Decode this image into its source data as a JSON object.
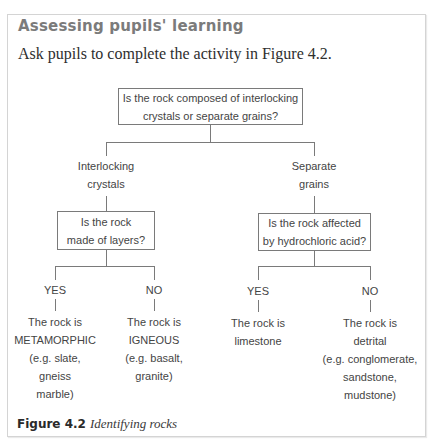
{
  "section": {
    "heading": "Assessing pupils' learning",
    "intro": "Ask pupils to complete the activity in Figure 4.2."
  },
  "flowchart": {
    "root": {
      "line1": "Is the rock composed of interlocking",
      "line2": "crystals or separate grains?"
    },
    "left_branch": {
      "label_line1": "Interlocking",
      "label_line2": "crystals",
      "question_line1": "Is the rock",
      "question_line2": "made of layers?",
      "yes": {
        "label": "YES",
        "lines": [
          "The rock is",
          "METAMORPHIC",
          "(e.g. slate,",
          "gneiss",
          "marble)"
        ]
      },
      "no": {
        "label": "NO",
        "lines": [
          "The rock is",
          "IGNEOUS",
          "(e.g. basalt,",
          "granite)"
        ]
      }
    },
    "right_branch": {
      "label_line1": "Separate",
      "label_line2": "grains",
      "question_line1": "Is the rock affected",
      "question_line2": "by hydrochloric acid?",
      "yes": {
        "label": "YES",
        "lines": [
          "The rock is",
          "limestone"
        ]
      },
      "no": {
        "label": "NO",
        "lines": [
          "The rock is",
          "detrital",
          "(e.g. conglomerate,",
          "sandstone,",
          "mudstone)"
        ]
      }
    }
  },
  "caption": {
    "number": "Figure 4.2",
    "title": "Identifying rocks"
  },
  "colors": {
    "heading": "#7b7b7b",
    "lines": "#7a7a7a",
    "text": "#444444"
  }
}
